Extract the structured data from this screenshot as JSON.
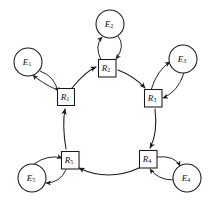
{
  "figure": {
    "background_color": "#ffffff",
    "stroke_color": "#1a1a1a",
    "width": 219,
    "height": 208
  },
  "resources": [
    {
      "id": "R1",
      "label": "R",
      "subscript": "1",
      "shape": "square",
      "cx": 66,
      "cy": 97
    },
    {
      "id": "R2",
      "label": "R",
      "subscript": "2",
      "shape": "square",
      "cx": 107,
      "cy": 68
    },
    {
      "id": "R3",
      "label": "R",
      "subscript": "3",
      "shape": "square",
      "cx": 153,
      "cy": 98
    },
    {
      "id": "R4",
      "label": "R",
      "subscript": "4",
      "shape": "square",
      "cx": 147,
      "cy": 159
    },
    {
      "id": "R5",
      "label": "R",
      "subscript": "5",
      "shape": "square",
      "cx": 70,
      "cy": 160
    }
  ],
  "entities": [
    {
      "id": "E1",
      "label": "E",
      "subscript": "1",
      "shape": "circle",
      "cx": 28,
      "cy": 62,
      "r": 14
    },
    {
      "id": "E2",
      "label": "E",
      "subscript": "2",
      "shape": "circle",
      "cx": 110,
      "cy": 24,
      "r": 14
    },
    {
      "id": "E3",
      "label": "E",
      "subscript": "3",
      "shape": "circle",
      "cx": 183,
      "cy": 59,
      "r": 14
    },
    {
      "id": "E4",
      "label": "E",
      "subscript": "4",
      "shape": "circle",
      "cx": 187,
      "cy": 178,
      "r": 14
    },
    {
      "id": "E5",
      "label": "E",
      "subscript": "5",
      "shape": "circle",
      "cx": 32,
      "cy": 178,
      "r": 14
    }
  ],
  "ring_edges": [
    {
      "from": "R1",
      "to": "R2",
      "direction": "clockwise"
    },
    {
      "from": "R2",
      "to": "R3",
      "direction": "clockwise"
    },
    {
      "from": "R3",
      "to": "R4",
      "direction": "clockwise"
    },
    {
      "from": "R4",
      "to": "R5",
      "direction": "clockwise"
    },
    {
      "from": "R5",
      "to": "R1",
      "direction": "clockwise"
    }
  ],
  "entity_edges": [
    {
      "pair": "E1-R1",
      "bidirectional": true
    },
    {
      "pair": "E2-R2",
      "bidirectional": true
    },
    {
      "pair": "E3-R3",
      "bidirectional": true
    },
    {
      "pair": "E4-R4",
      "bidirectional": true
    },
    {
      "pair": "E5-R5",
      "bidirectional": true
    }
  ]
}
